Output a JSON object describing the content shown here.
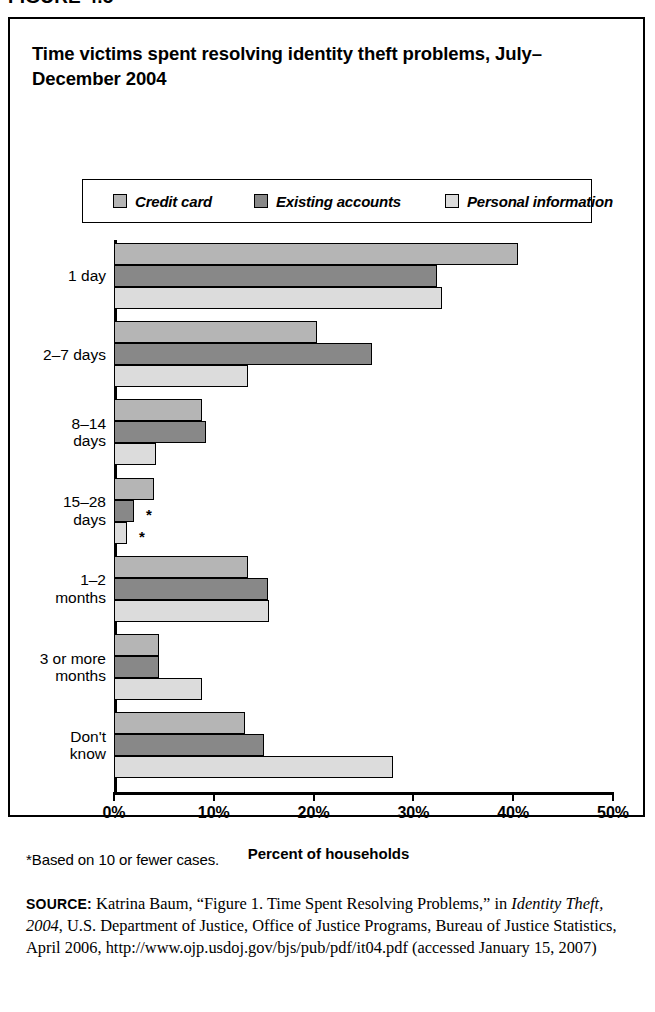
{
  "figure_number": "FIGURE 4.5",
  "title": "Time victims spent resolving identity theft problems, July–December 2004",
  "axis_title": "Percent of households",
  "footnote": "*Based on 10 or fewer cases.",
  "source": {
    "keyword": "SOURCE:",
    "part1": " Katrina Baum, “Figure 1. Time Spent Resolving Problems,” in ",
    "italic": "Identity Theft, 2004",
    "part2": ", U.S. Department of Justice, Office of Justice Programs, Bureau of Justice Statistics, April 2006, http://www.ojp.usdoj.gov/bjs/pub/pdf/it04.pdf (accessed January 15, 2007)"
  },
  "colors": {
    "credit_card": "#b5b5b5",
    "existing_accounts": "#888888",
    "personal_information": "#dcdcdc",
    "outline": "#000000"
  },
  "chart_data": {
    "type": "bar",
    "orientation": "horizontal",
    "title": "Time victims spent resolving identity theft problems, July–December 2004",
    "xlabel": "Percent of households",
    "ylabel": "",
    "xlim": [
      0,
      50
    ],
    "grid": false,
    "legend_position": "top",
    "tick_labels": [
      "0%",
      "10%",
      "20%",
      "30%",
      "40%",
      "50%"
    ],
    "tick_values": [
      0,
      10,
      20,
      30,
      40,
      50
    ],
    "categories": [
      "1 day",
      "2–7 days",
      "8–14\ndays",
      "15–28\ndays",
      "1–2\nmonths",
      "3 or more\nmonths",
      "Don't\nknow"
    ],
    "series": [
      {
        "name": "Credit card",
        "color": "#b5b5b5",
        "values": [
          40.5,
          20.3,
          8.8,
          4.0,
          13.4,
          4.5,
          13.1
        ],
        "footnote_marks": [
          false,
          false,
          false,
          false,
          false,
          false,
          false
        ]
      },
      {
        "name": "Existing accounts",
        "color": "#888888",
        "values": [
          32.4,
          25.9,
          9.2,
          2.0,
          15.4,
          4.5,
          15.0
        ],
        "footnote_marks": [
          false,
          false,
          false,
          true,
          false,
          false,
          false
        ]
      },
      {
        "name": "Personal information",
        "color": "#dcdcdc",
        "values": [
          32.9,
          13.4,
          4.2,
          1.3,
          15.5,
          8.8,
          28.0
        ],
        "footnote_marks": [
          false,
          false,
          false,
          true,
          false,
          false,
          false
        ]
      }
    ]
  }
}
